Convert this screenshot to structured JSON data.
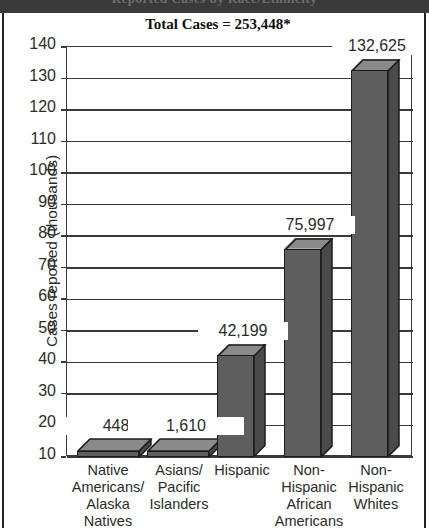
{
  "page": {
    "banner_text": "Reported Cases by Race/Ethnicity",
    "background_color": "#ffffff",
    "rule_color": "#222222"
  },
  "chart_data": {
    "type": "bar",
    "title": "Total Cases = 253,448*",
    "xlabel": "",
    "ylabel": "Cases reported (thousands)",
    "ylim": [
      0,
      140
    ],
    "yticks": [
      10,
      20,
      30,
      40,
      50,
      60,
      70,
      80,
      90,
      100,
      110,
      120,
      130,
      140
    ],
    "grid": true,
    "legend": "none",
    "units": "thousands of cases",
    "categories": [
      "Native Americans/ Alaska Natives",
      "Asians/ Pacific Islanders",
      "Hispanic",
      "Non-Hispanic African Americans",
      "Non-Hispanic Whites"
    ],
    "category_lines": [
      [
        "Native",
        "Americans/",
        "Alaska",
        "Natives"
      ],
      [
        "Asians/",
        "Pacific",
        "Islanders"
      ],
      [
        "Hispanic"
      ],
      [
        "Non-",
        "Hispanic",
        "African",
        "Americans"
      ],
      [
        "Non-",
        "Hispanic",
        "Whites"
      ]
    ],
    "values": [
      0.448,
      1.61,
      42.199,
      75.997,
      132.625
    ],
    "data_labels": [
      "448",
      "1,610",
      "42,199",
      "75,997",
      "132,625"
    ],
    "bar_color": "#5e5e5e",
    "bar_top_color": "#8a8a8a",
    "bar_side_color": "#4a4a4a",
    "bar_edge_color": "#1c1c1c"
  }
}
